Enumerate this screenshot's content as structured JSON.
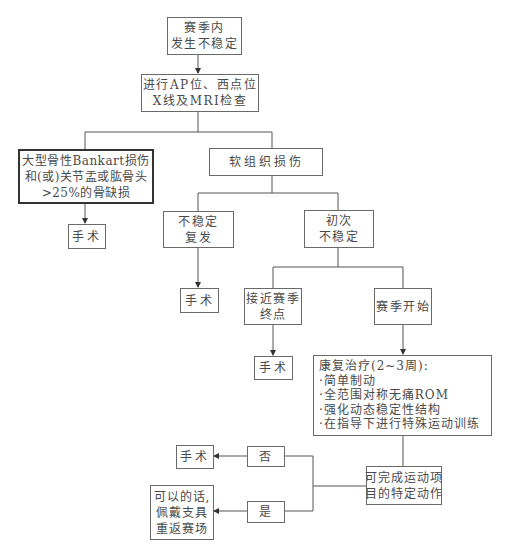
{
  "diagram": {
    "type": "flowchart",
    "line_color": "#555555",
    "text_color": "#4a4a4a",
    "nodes": [
      {
        "id": "in-season-instability",
        "lines": [
          "赛季内",
          "发生不稳定"
        ]
      },
      {
        "id": "imaging",
        "lines": [
          "进行AP位、西点位",
          "X线及MRI检查"
        ]
      },
      {
        "id": "bony-bankart",
        "lines": [
          "大型骨性Bankart损伤",
          "和(或)关节盂或肱骨头",
          ">25%的骨缺损"
        ]
      },
      {
        "id": "soft-tissue",
        "lines": [
          "软组织损伤"
        ]
      },
      {
        "id": "surgery-1",
        "lines": [
          "手术"
        ]
      },
      {
        "id": "recurrent",
        "lines": [
          "不稳定",
          "复发"
        ]
      },
      {
        "id": "first-time",
        "lines": [
          "初次",
          "不稳定"
        ]
      },
      {
        "id": "surgery-2",
        "lines": [
          "手术"
        ]
      },
      {
        "id": "near-season-end",
        "lines": [
          "接近赛季",
          "终点"
        ]
      },
      {
        "id": "season-start",
        "lines": [
          "赛季开始"
        ]
      },
      {
        "id": "surgery-3",
        "lines": [
          "手术"
        ]
      },
      {
        "id": "rehab",
        "lines": [
          "康复治疗(2~3周):",
          "·简单制动",
          "·全范围对称无痛ROM",
          "·强化动态稳定性结构",
          "·在指导下进行特殊运动训练"
        ]
      },
      {
        "id": "sport-specific",
        "lines": [
          "可完成运动项",
          "目的特定动作"
        ]
      },
      {
        "id": "no",
        "lines": [
          "否"
        ]
      },
      {
        "id": "yes",
        "lines": [
          "是"
        ]
      },
      {
        "id": "surgery-4",
        "lines": [
          "手术"
        ]
      },
      {
        "id": "return-to-play",
        "lines": [
          "可以的话,",
          "佩戴支具",
          "重返赛场"
        ]
      }
    ],
    "edges": [
      [
        "in-season-instability",
        "imaging"
      ],
      [
        "imaging",
        "bony-bankart"
      ],
      [
        "imaging",
        "soft-tissue"
      ],
      [
        "bony-bankart",
        "surgery-1"
      ],
      [
        "soft-tissue",
        "recurrent"
      ],
      [
        "soft-tissue",
        "first-time"
      ],
      [
        "recurrent",
        "surgery-2"
      ],
      [
        "first-time",
        "near-season-end"
      ],
      [
        "first-time",
        "season-start"
      ],
      [
        "near-season-end",
        "surgery-3"
      ],
      [
        "season-start",
        "rehab"
      ],
      [
        "rehab",
        "sport-specific"
      ],
      [
        "sport-specific",
        "no"
      ],
      [
        "sport-specific",
        "yes"
      ],
      [
        "no",
        "surgery-4"
      ],
      [
        "yes",
        "return-to-play"
      ]
    ]
  }
}
